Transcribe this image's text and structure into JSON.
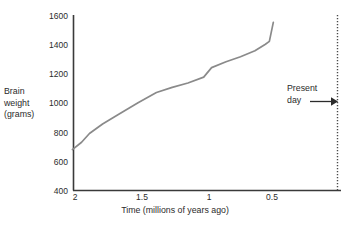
{
  "chart_data": {
    "type": "line",
    "title": "",
    "xlabel": "Time (millions of years ago)",
    "ylabel": "Brain weight (grams)",
    "ylabel_lines": [
      "Brain",
      "weight",
      "(grams)"
    ],
    "x_ticks": [
      "2",
      "1.5",
      "1",
      "0.5"
    ],
    "x_tick_values": [
      2,
      1.5,
      1,
      0.5
    ],
    "y_ticks": [
      "400",
      "600",
      "800",
      "1000",
      "1200",
      "1400",
      "1600"
    ],
    "y_tick_values": [
      400,
      600,
      800,
      1000,
      1200,
      1400,
      1600
    ],
    "xlim": [
      2.08,
      0.0
    ],
    "ylim": [
      400,
      1600
    ],
    "x_axis_inverted": true,
    "grid": false,
    "legend": null,
    "series": [
      {
        "name": "Hominin brain weight",
        "x": [
          2.02,
          1.95,
          1.89,
          1.79,
          1.67,
          1.52,
          1.38,
          1.26,
          1.14,
          1.02,
          0.96,
          0.85,
          0.74,
          0.63,
          0.55,
          0.52,
          0.49
        ],
        "values": [
          680,
          730,
          790,
          855,
          920,
          1000,
          1070,
          1105,
          1135,
          1175,
          1240,
          1280,
          1315,
          1355,
          1400,
          1420,
          1550
        ]
      }
    ],
    "annotations": [
      {
        "name": "present-day",
        "text_lines": [
          "Present",
          "day"
        ],
        "text": "Present day",
        "marker": "dotted-vertical-line",
        "arrow": "right"
      }
    ],
    "colors": {
      "line": "#8a8a8a",
      "axis": "#3a3a3a",
      "text": "#2b2b2b",
      "present_day_line": "#4a4a4a",
      "background": "#ffffff"
    }
  }
}
